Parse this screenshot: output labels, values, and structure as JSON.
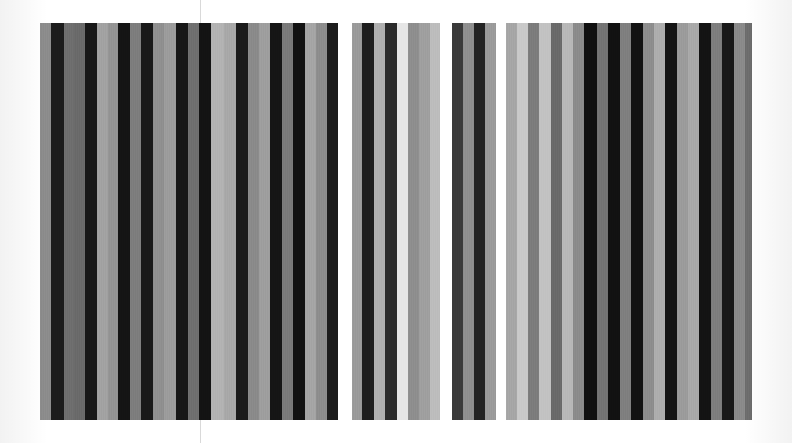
{
  "artwork": {
    "title": "Vertical Stripe Panels",
    "medium": "grayscale stripe panels",
    "canvas": {
      "width": 792,
      "height": 443,
      "background": "#ffffff"
    },
    "fold_line": {
      "x": 200,
      "top_y": 0,
      "bottom_y": 443,
      "color": "#d9d9d9",
      "label": "fold-line"
    },
    "panels": [
      {
        "label": "panel-1",
        "x": 40,
        "y": 23,
        "width": 298,
        "height": 397,
        "stripes": [
          {
            "color": "#8c8c8c",
            "width": 11
          },
          {
            "color": "#1b1b1b",
            "width": 13
          },
          {
            "color": "#6e6e6e",
            "width": 10
          },
          {
            "color": "#6a6a6a",
            "width": 11
          },
          {
            "color": "#171717",
            "width": 12
          },
          {
            "color": "#a2a2a2",
            "width": 11
          },
          {
            "color": "#949494",
            "width": 10
          },
          {
            "color": "#141414",
            "width": 12
          },
          {
            "color": "#7d7d7d",
            "width": 11
          },
          {
            "color": "#181818",
            "width": 12
          },
          {
            "color": "#8f8f8f",
            "width": 11
          },
          {
            "color": "#9c9c9c",
            "width": 12
          },
          {
            "color": "#161616",
            "width": 12
          },
          {
            "color": "#6f6f6f",
            "width": 11
          },
          {
            "color": "#131313",
            "width": 12
          },
          {
            "color": "#b3b3b3",
            "width": 12
          },
          {
            "color": "#a8a8a8",
            "width": 12
          },
          {
            "color": "#1a1a1a",
            "width": 12
          },
          {
            "color": "#8a8a8a",
            "width": 11
          },
          {
            "color": "#9e9e9e",
            "width": 11
          },
          {
            "color": "#151515",
            "width": 12
          },
          {
            "color": "#7a7a7a",
            "width": 11
          },
          {
            "color": "#121212",
            "width": 12
          },
          {
            "color": "#a5a5a5",
            "width": 11
          },
          {
            "color": "#8d8d8d",
            "width": 11
          },
          {
            "color": "#1c1c1c",
            "width": 11
          }
        ]
      },
      {
        "label": "panel-2",
        "x": 352,
        "y": 23,
        "width": 88,
        "height": 397,
        "stripes": [
          {
            "color": "#9a9a9a",
            "width": 10
          },
          {
            "color": "#1d1d1d",
            "width": 12
          },
          {
            "color": "#b0b0b0",
            "width": 11
          },
          {
            "color": "#2a2a2a",
            "width": 12
          },
          {
            "color": "#e6e6e6",
            "width": 11
          },
          {
            "color": "#8e8e8e",
            "width": 11
          },
          {
            "color": "#9f9f9f",
            "width": 11
          },
          {
            "color": "#bdbdbd",
            "width": 10
          }
        ]
      },
      {
        "label": "panel-3",
        "x": 452,
        "y": 23,
        "width": 44,
        "height": 397,
        "stripes": [
          {
            "color": "#3a3a3a",
            "width": 11
          },
          {
            "color": "#8f8f8f",
            "width": 11
          },
          {
            "color": "#232323",
            "width": 11
          },
          {
            "color": "#9b9b9b",
            "width": 11
          }
        ]
      },
      {
        "label": "panel-4",
        "x": 506,
        "y": 23,
        "width": 246,
        "height": 397,
        "stripes": [
          {
            "color": "#a6a6a6",
            "width": 11
          },
          {
            "color": "#c9c9c9",
            "width": 11
          },
          {
            "color": "#7c7c7c",
            "width": 11
          },
          {
            "color": "#c2c2c2",
            "width": 12
          },
          {
            "color": "#6a6a6a",
            "width": 11
          },
          {
            "color": "#b8b8b8",
            "width": 11
          },
          {
            "color": "#8b8b8b",
            "width": 11
          },
          {
            "color": "#0f0f0f",
            "width": 13
          },
          {
            "color": "#747474",
            "width": 11
          },
          {
            "color": "#111111",
            "width": 12
          },
          {
            "color": "#7f7f7f",
            "width": 11
          },
          {
            "color": "#121212",
            "width": 12
          },
          {
            "color": "#8d8d8d",
            "width": 11
          },
          {
            "color": "#aeaeae",
            "width": 11
          },
          {
            "color": "#141414",
            "width": 12
          },
          {
            "color": "#9b9b9b",
            "width": 11
          },
          {
            "color": "#a9a9a9",
            "width": 11
          },
          {
            "color": "#131313",
            "width": 12
          },
          {
            "color": "#7e7e7e",
            "width": 11
          },
          {
            "color": "#181818",
            "width": 12
          },
          {
            "color": "#8a8a8a",
            "width": 11
          },
          {
            "color": "#6d6d6d",
            "width": 7
          }
        ]
      }
    ]
  }
}
